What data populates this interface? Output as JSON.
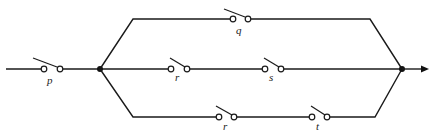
{
  "diagram": {
    "type": "switching circuit",
    "colors": {
      "line": "#1a1a1a",
      "background": "#ffffff"
    },
    "switches": [
      {
        "id": "p",
        "label": "p",
        "branch": "input"
      },
      {
        "id": "q",
        "label": "q",
        "branch": "top"
      },
      {
        "id": "r_mid",
        "label": "r",
        "branch": "middle"
      },
      {
        "id": "s",
        "label": "s",
        "branch": "middle"
      },
      {
        "id": "r_bot",
        "label": "r",
        "branch": "bottom"
      },
      {
        "id": "t",
        "label": "t",
        "branch": "bottom"
      }
    ],
    "labels": {
      "p": "p",
      "q": "q",
      "r_mid": "r",
      "s": "s",
      "r_bot": "r",
      "t": "t"
    },
    "nodes": [
      "left-junction",
      "right-junction"
    ],
    "output": "arrow"
  }
}
